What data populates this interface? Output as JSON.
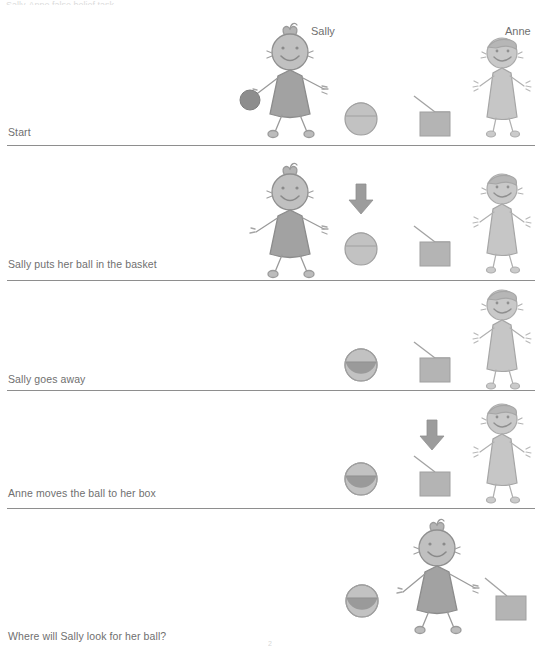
{
  "document": {
    "title_partial": "Sally-Anne false belief task",
    "page_number": "2"
  },
  "characters": {
    "sally": {
      "name": "Sally",
      "dress_color": "#a2a2a2",
      "outline_color": "#8c8c8c"
    },
    "anne": {
      "name": "Anne",
      "dress_color": "#c6c6c6",
      "outline_color": "#a6a6a6"
    }
  },
  "objects": {
    "ball": {
      "label": "ball",
      "color": "#8d8d8d"
    },
    "basket": {
      "label": "basket",
      "color": "#bdbdbd",
      "contents_color": "#9a9a9a"
    },
    "box": {
      "label": "box",
      "color": "#b4b4b4"
    },
    "arrow": {
      "label": "arrow",
      "color": "#9c9c9c"
    }
  },
  "rows": [
    {
      "id": "start",
      "label": "Start",
      "sally_present": true,
      "sally_holds_ball": true,
      "anne_present": true,
      "basket_has_ball": false,
      "box_has_ball": false,
      "arrow": "none",
      "show_names": true
    },
    {
      "id": "sally-puts-ball",
      "label": "Sally puts her ball in the basket",
      "sally_present": true,
      "sally_holds_ball": false,
      "anne_present": true,
      "basket_has_ball": false,
      "box_has_ball": false,
      "arrow": "basket",
      "show_names": false
    },
    {
      "id": "sally-goes-away",
      "label": "Sally goes away",
      "sally_present": false,
      "sally_holds_ball": false,
      "anne_present": true,
      "basket_has_ball": true,
      "box_has_ball": false,
      "arrow": "none",
      "show_names": false
    },
    {
      "id": "anne-moves-ball",
      "label": "Anne moves the ball to her box",
      "sally_present": false,
      "sally_holds_ball": false,
      "anne_present": true,
      "basket_has_ball": true,
      "box_has_ball": false,
      "arrow": "box",
      "show_names": false
    },
    {
      "id": "where-will-sally-look",
      "label": "Where will Sally look for her ball?",
      "sally_present": true,
      "sally_holds_ball": false,
      "anne_present": false,
      "basket_has_ball": true,
      "box_has_ball": true,
      "arrow": "none",
      "show_names": false
    }
  ]
}
